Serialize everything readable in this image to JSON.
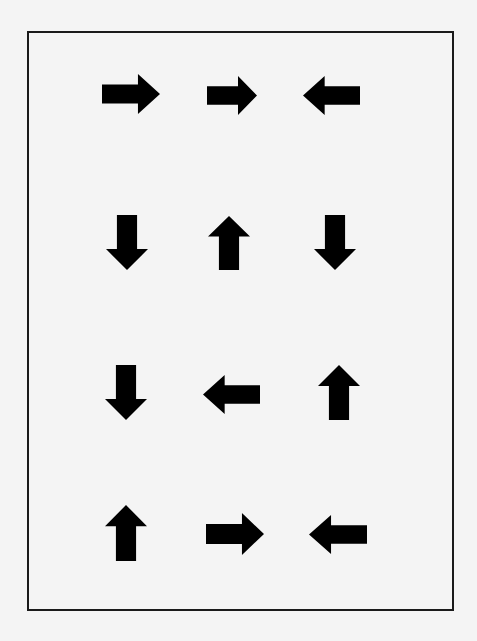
{
  "page": {
    "background": "#f4f4f4",
    "frame_color": "#1a1a1a",
    "arrow_color": "#000000"
  },
  "grid": {
    "rows": [
      [
        "right",
        "right",
        "left"
      ],
      [
        "down",
        "up",
        "down"
      ],
      [
        "down",
        "left",
        "up"
      ],
      [
        "up",
        "right",
        "left"
      ]
    ]
  },
  "arrows": [
    {
      "row": 1,
      "col": 1,
      "direction": "right",
      "x": 102,
      "y": 74,
      "w": 58,
      "h": 40
    },
    {
      "row": 1,
      "col": 2,
      "direction": "right",
      "x": 207,
      "y": 76,
      "w": 50,
      "h": 39
    },
    {
      "row": 1,
      "col": 3,
      "direction": "left",
      "x": 303,
      "y": 76,
      "w": 57,
      "h": 39
    },
    {
      "row": 2,
      "col": 1,
      "direction": "down",
      "x": 106,
      "y": 215,
      "w": 42,
      "h": 55
    },
    {
      "row": 2,
      "col": 2,
      "direction": "up",
      "x": 208,
      "y": 216,
      "w": 42,
      "h": 54
    },
    {
      "row": 2,
      "col": 3,
      "direction": "down",
      "x": 314,
      "y": 215,
      "w": 42,
      "h": 55
    },
    {
      "row": 3,
      "col": 1,
      "direction": "down",
      "x": 105,
      "y": 365,
      "w": 42,
      "h": 55
    },
    {
      "row": 3,
      "col": 2,
      "direction": "left",
      "x": 203,
      "y": 375,
      "w": 57,
      "h": 39
    },
    {
      "row": 3,
      "col": 3,
      "direction": "up",
      "x": 318,
      "y": 365,
      "w": 42,
      "h": 55
    },
    {
      "row": 4,
      "col": 1,
      "direction": "up",
      "x": 105,
      "y": 505,
      "w": 42,
      "h": 56
    },
    {
      "row": 4,
      "col": 2,
      "direction": "right",
      "x": 206,
      "y": 513,
      "w": 58,
      "h": 42
    },
    {
      "row": 4,
      "col": 3,
      "direction": "left",
      "x": 309,
      "y": 515,
      "w": 58,
      "h": 39
    }
  ]
}
